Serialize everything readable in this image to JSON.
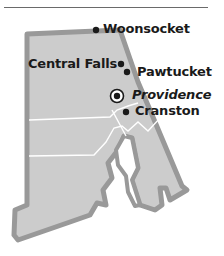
{
  "map": {
    "title": "",
    "state_fill": "#cccccc",
    "state_border": "#999999",
    "county_line": "#ffffff",
    "cities": [
      {
        "name": "Woonsocket",
        "type": "city",
        "x": 96,
        "y": 30
      },
      {
        "name": "Central Falls",
        "type": "city",
        "x": 121,
        "y": 64
      },
      {
        "name": "Pawtucket",
        "type": "city",
        "x": 127,
        "y": 71
      },
      {
        "name": "Providence",
        "type": "capital",
        "x": 117,
        "y": 96
      },
      {
        "name": "Cranston",
        "type": "city",
        "x": 126,
        "y": 112
      }
    ]
  }
}
